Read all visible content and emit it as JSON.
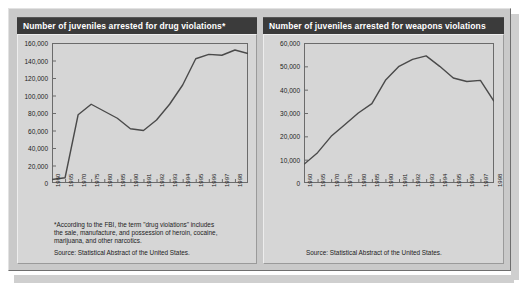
{
  "panels": [
    {
      "title": "Number of juveniles arrested for drug violations*",
      "footnote": "*According to the FBI, the term \"drug violations\" includes\nthe sale, manufacture, and possession of heroin, cocaine,\nmarijuana, and other narcotics.",
      "source": "Source: Statistical Abstract of the United States."
    },
    {
      "title": "Number of juveniles arrested for weapons violations",
      "footnote": "",
      "source": "Source: Statistical Abstract of the United States."
    }
  ],
  "chart_data": [
    {
      "type": "line",
      "title": "Number of juveniles arrested for drug violations*",
      "xlabel": "",
      "ylabel": "",
      "ylim": [
        0,
        160000
      ],
      "yticks": [
        0,
        20000,
        40000,
        60000,
        80000,
        100000,
        120000,
        140000,
        160000
      ],
      "ytick_labels": [
        "0",
        "20,000",
        "40,000",
        "60,000",
        "80,000",
        "100,000",
        "120,000",
        "140,000",
        "160,000"
      ],
      "grid": false,
      "legend": "none",
      "line_color": "#4a4a4a",
      "categories": [
        "1960",
        "1965",
        "1970",
        "1975",
        "1980",
        "1985",
        "1990",
        "1991",
        "1992",
        "1993",
        "1994",
        "1995",
        "1996",
        "1997",
        "1998"
      ],
      "values": [
        4000,
        6000,
        78000,
        90000,
        82000,
        74000,
        62000,
        60000,
        72000,
        90000,
        112000,
        142000,
        147000,
        146000,
        152000,
        148000
      ]
    },
    {
      "type": "line",
      "title": "Number of juveniles arrested for weapons violations",
      "xlabel": "",
      "ylabel": "",
      "ylim": [
        0,
        60000
      ],
      "yticks": [
        0,
        10000,
        20000,
        30000,
        40000,
        50000,
        60000
      ],
      "ytick_labels": [
        "0",
        "10,000",
        "20,000",
        "30,000",
        "40,000",
        "50,000",
        "60,000"
      ],
      "grid": false,
      "legend": "none",
      "line_color": "#4a4a4a",
      "categories": [
        "1960",
        "1965",
        "1970",
        "1975",
        "1980",
        "1985",
        "1990",
        "1991",
        "1992",
        "1993",
        "1994",
        "1995",
        "1996",
        "1997",
        "1998"
      ],
      "values": [
        8000,
        13000,
        20000,
        25000,
        30000,
        34000,
        44000,
        50000,
        53000,
        54500,
        50000,
        45000,
        43500,
        44000,
        35000
      ]
    }
  ]
}
